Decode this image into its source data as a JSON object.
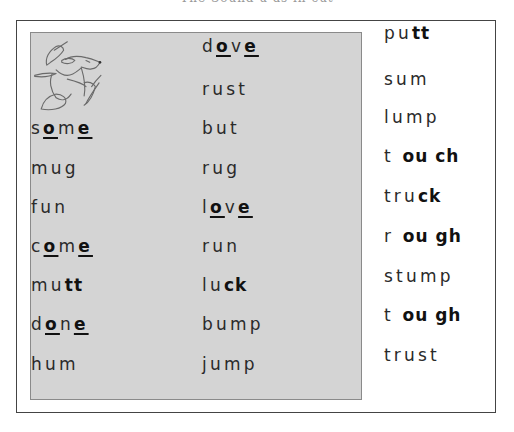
{
  "title": "The Sound u as in cut",
  "columns": [
    {
      "name": "left",
      "words": [
        {
          "segments": [
            {
              "t": "s",
              "s": "n"
            },
            {
              "t": "o",
              "s": "u"
            },
            {
              "t": "m",
              "s": "n"
            },
            {
              "t": "e",
              "s": "u"
            }
          ]
        },
        {
          "segments": [
            {
              "t": "mug",
              "s": "n"
            }
          ]
        },
        {
          "segments": [
            {
              "t": "fun",
              "s": "n"
            }
          ]
        },
        {
          "segments": [
            {
              "t": "c",
              "s": "n"
            },
            {
              "t": "o",
              "s": "u"
            },
            {
              "t": "m",
              "s": "n"
            },
            {
              "t": "e",
              "s": "u"
            }
          ]
        },
        {
          "segments": [
            {
              "t": "mu",
              "s": "n"
            },
            {
              "t": "tt",
              "s": "b"
            }
          ]
        },
        {
          "segments": [
            {
              "t": "d",
              "s": "n"
            },
            {
              "t": "o",
              "s": "u"
            },
            {
              "t": "n",
              "s": "n"
            },
            {
              "t": "e",
              "s": "u"
            }
          ]
        },
        {
          "segments": [
            {
              "t": "hum",
              "s": "n"
            }
          ]
        }
      ]
    },
    {
      "name": "middle",
      "words": [
        {
          "segments": [
            {
              "t": "d",
              "s": "n"
            },
            {
              "t": "o",
              "s": "u"
            },
            {
              "t": "v",
              "s": "n"
            },
            {
              "t": "e",
              "s": "u"
            }
          ]
        },
        {
          "segments": [
            {
              "t": "rust",
              "s": "n"
            }
          ]
        },
        {
          "segments": [
            {
              "t": "but",
              "s": "n"
            }
          ]
        },
        {
          "segments": [
            {
              "t": "rug",
              "s": "n"
            }
          ]
        },
        {
          "segments": [
            {
              "t": "l",
              "s": "n"
            },
            {
              "t": "o",
              "s": "u"
            },
            {
              "t": "v",
              "s": "n"
            },
            {
              "t": "e",
              "s": "u"
            }
          ]
        },
        {
          "segments": [
            {
              "t": "run",
              "s": "n"
            }
          ]
        },
        {
          "segments": [
            {
              "t": "lu",
              "s": "n"
            },
            {
              "t": "ck",
              "s": "b"
            }
          ]
        },
        {
          "segments": [
            {
              "t": "bump",
              "s": "n"
            }
          ]
        },
        {
          "segments": [
            {
              "t": "jump",
              "s": "n"
            }
          ]
        }
      ]
    },
    {
      "name": "right",
      "words": [
        {
          "segments": [
            {
              "t": "pu",
              "s": "n"
            },
            {
              "t": "tt",
              "s": "b"
            }
          ]
        },
        {
          "segments": [
            {
              "t": "sum",
              "s": "n"
            }
          ]
        },
        {
          "segments": [
            {
              "t": "lump",
              "s": "n"
            }
          ]
        },
        {
          "segments": [
            {
              "t": "t ",
              "s": "n"
            },
            {
              "t": "ou ch",
              "s": "b"
            }
          ]
        },
        {
          "segments": [
            {
              "t": "tru",
              "s": "n"
            },
            {
              "t": "ck",
              "s": "b"
            }
          ]
        },
        {
          "segments": [
            {
              "t": "r ",
              "s": "n"
            },
            {
              "t": "ou gh",
              "s": "b"
            }
          ]
        },
        {
          "segments": [
            {
              "t": "stump",
              "s": "n"
            }
          ]
        },
        {
          "segments": [
            {
              "t": "t ",
              "s": "n"
            },
            {
              "t": "ou gh",
              "s": "b"
            }
          ]
        },
        {
          "segments": [
            {
              "t": "trust",
              "s": "n"
            }
          ]
        }
      ]
    }
  ],
  "illustration": {
    "icon": "dog-running-with-hat-icon"
  },
  "colors": {
    "panel_background": "#d4d4d4",
    "frame_border": "#444444",
    "text": "#2a2a2a"
  }
}
